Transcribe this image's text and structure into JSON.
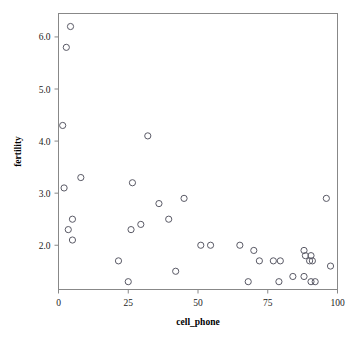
{
  "chart_data": {
    "type": "scatter",
    "title": "",
    "xlabel": "cell_phone",
    "ylabel": "fertility",
    "xlim": [
      0,
      100
    ],
    "ylim": [
      1.15,
      6.45
    ],
    "grid": false,
    "legend": null,
    "xticks": [
      0,
      25,
      50,
      75,
      100
    ],
    "xtick_labels": [
      "0",
      "25",
      "50",
      "75",
      "100"
    ],
    "yticks": [
      2.0,
      3.0,
      4.0,
      5.0,
      6.0
    ],
    "ytick_labels": [
      "2.0",
      "3.0",
      "4.0",
      "5.0",
      "6.0"
    ],
    "marker": "open-circle",
    "marker_color": "#5a5a66",
    "points": [
      {
        "x": 4.3,
        "y": 6.2
      },
      {
        "x": 2.8,
        "y": 5.8
      },
      {
        "x": 1.5,
        "y": 4.3
      },
      {
        "x": 32.0,
        "y": 4.1
      },
      {
        "x": 8.0,
        "y": 3.3
      },
      {
        "x": 26.5,
        "y": 3.2
      },
      {
        "x": 2.0,
        "y": 3.1
      },
      {
        "x": 45.0,
        "y": 2.9
      },
      {
        "x": 96.0,
        "y": 2.9
      },
      {
        "x": 36.0,
        "y": 2.8
      },
      {
        "x": 5.0,
        "y": 2.5
      },
      {
        "x": 39.5,
        "y": 2.5
      },
      {
        "x": 29.5,
        "y": 2.4
      },
      {
        "x": 3.5,
        "y": 2.3
      },
      {
        "x": 26.0,
        "y": 2.3
      },
      {
        "x": 5.0,
        "y": 2.1
      },
      {
        "x": 51.0,
        "y": 2.0
      },
      {
        "x": 54.5,
        "y": 2.0
      },
      {
        "x": 65.0,
        "y": 2.0
      },
      {
        "x": 88.0,
        "y": 1.9
      },
      {
        "x": 70.0,
        "y": 1.9
      },
      {
        "x": 88.5,
        "y": 1.8
      },
      {
        "x": 90.5,
        "y": 1.8
      },
      {
        "x": 21.5,
        "y": 1.7
      },
      {
        "x": 72.0,
        "y": 1.7
      },
      {
        "x": 77.0,
        "y": 1.7
      },
      {
        "x": 79.5,
        "y": 1.7
      },
      {
        "x": 90.0,
        "y": 1.7
      },
      {
        "x": 91.0,
        "y": 1.7
      },
      {
        "x": 97.5,
        "y": 1.6
      },
      {
        "x": 42.0,
        "y": 1.5
      },
      {
        "x": 84.0,
        "y": 1.4
      },
      {
        "x": 88.0,
        "y": 1.4
      },
      {
        "x": 25.0,
        "y": 1.3
      },
      {
        "x": 68.0,
        "y": 1.3
      },
      {
        "x": 79.0,
        "y": 1.3
      },
      {
        "x": 90.5,
        "y": 1.3
      },
      {
        "x": 92.0,
        "y": 1.3
      }
    ]
  }
}
